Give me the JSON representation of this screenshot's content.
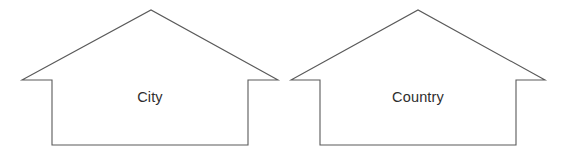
{
  "diagram": {
    "type": "house-outline-pair",
    "background_color": "#ffffff",
    "stroke_color": "#5a5a5a",
    "text_color": "#2e2e2e",
    "houses": [
      {
        "id": "house-city",
        "label": "City",
        "label_x": 150,
        "label_y": 98,
        "outline_points": "22,80 52,80 52,80 151,10 278,80 248,80 248,145 52,145 52,80",
        "path": "M 22 80 L 151 10 L 278 80 L 248 80 L 248 145 L 52 145 L 52 80 Z"
      },
      {
        "id": "house-country",
        "label": "Country",
        "label_x": 418,
        "label_y": 98,
        "outline_points": "291,80 320,80 418,10 545,80 516,80 516,145 320,145 320,80",
        "path": "M 291 80 L 418 10 L 545 80 L 516 80 L 516 145 L 320 145 L 320 80 Z"
      }
    ]
  }
}
